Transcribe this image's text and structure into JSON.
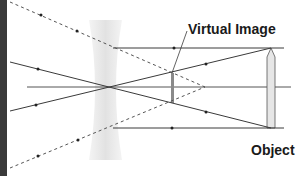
{
  "diagram": {
    "type": "ray-diagram",
    "labels": {
      "virtual_image": "Virtual Image",
      "object": "Object"
    },
    "colors": {
      "ray": "#3a3a3a",
      "dashed_ray": "#555555",
      "lens_fill": "#e8e8e8",
      "object_fill": "#e6e6e6",
      "image_bar": "#8a8a8a",
      "edge_strip": "#3a3a3a",
      "text": "#1a1a1a"
    },
    "elements": [
      {
        "id": "lens",
        "kind": "concave-lens",
        "center_x": 110
      },
      {
        "id": "optical-axis",
        "kind": "solid-line"
      },
      {
        "id": "object",
        "kind": "upright-arrow",
        "x": 271
      },
      {
        "id": "virtual-image",
        "kind": "upright-bar",
        "x": 172
      },
      {
        "id": "ray-parallel-top",
        "kind": "solid-ray"
      },
      {
        "id": "ray-parallel-bottom",
        "kind": "solid-ray"
      },
      {
        "id": "ray-through-center-1",
        "kind": "solid-ray"
      },
      {
        "id": "ray-through-center-2",
        "kind": "solid-ray"
      },
      {
        "id": "ray-diverging-top",
        "kind": "dashed-ray"
      },
      {
        "id": "ray-diverging-bottom",
        "kind": "dashed-ray"
      }
    ]
  }
}
